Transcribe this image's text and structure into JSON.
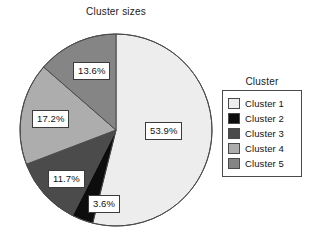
{
  "chart_data": {
    "type": "pie",
    "title": "Cluster sizes",
    "categories": [
      "Cluster 1",
      "Cluster 2",
      "Cluster 3",
      "Cluster 4",
      "Cluster 5"
    ],
    "values": [
      53.9,
      3.6,
      11.7,
      17.2,
      13.6
    ],
    "value_labels": [
      "53.9%",
      "3.6%",
      "11.7%",
      "17.2%",
      "13.6%"
    ],
    "colors": [
      "#ededed",
      "#0d0d0d",
      "#4b4b4b",
      "#adadad",
      "#858585"
    ],
    "legend_title": "Cluster",
    "legend_position": "right",
    "start_angle_deg": 0,
    "direction": "clockwise",
    "grid": false,
    "xlabel": "",
    "ylabel": ""
  },
  "title": {
    "text": "Cluster sizes"
  },
  "legend": {
    "title": "Cluster",
    "items": [
      {
        "label": "Cluster 1",
        "color": "#ededed"
      },
      {
        "label": "Cluster 2",
        "color": "#0d0d0d"
      },
      {
        "label": "Cluster 3",
        "color": "#4b4b4b"
      },
      {
        "label": "Cluster 4",
        "color": "#adadad"
      },
      {
        "label": "Cluster 5",
        "color": "#858585"
      }
    ]
  },
  "slice_labels": [
    {
      "text": "53.9%",
      "left": 127,
      "top": 90
    },
    {
      "text": "13.6%",
      "left": 55,
      "top": 30
    },
    {
      "text": "17.2%",
      "left": 14,
      "top": 78
    },
    {
      "text": "11.7%",
      "left": 30,
      "top": 138
    },
    {
      "text": "3.6%",
      "left": 70,
      "top": 163
    }
  ]
}
